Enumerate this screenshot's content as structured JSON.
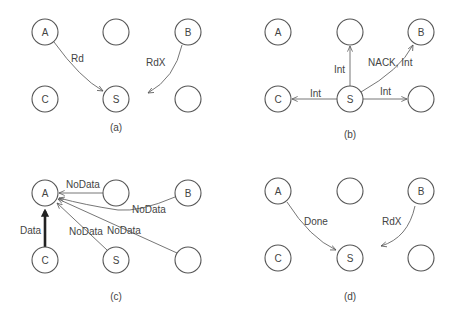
{
  "figure": {
    "panels": [
      {
        "id": "a",
        "caption": "(a)",
        "nodes": [
          {
            "id": "A",
            "label": "A",
            "x": 45,
            "y": 32
          },
          {
            "id": "top-mid",
            "label": "",
            "x": 116,
            "y": 32
          },
          {
            "id": "B",
            "label": "B",
            "x": 188,
            "y": 32
          },
          {
            "id": "C",
            "label": "C",
            "x": 45,
            "y": 99
          },
          {
            "id": "S",
            "label": "S",
            "x": 116,
            "y": 99
          },
          {
            "id": "right",
            "label": "",
            "x": 188,
            "y": 99
          }
        ],
        "edges": [
          {
            "from": "A",
            "to": "S",
            "label": "Rd",
            "bold": false
          },
          {
            "from": "B",
            "to": "S",
            "label": "RdX",
            "bold": false,
            "stops_short": true
          }
        ]
      },
      {
        "id": "b",
        "caption": "(b)",
        "nodes": [
          {
            "id": "A",
            "label": "A",
            "x": 278,
            "y": 32
          },
          {
            "id": "top-mid",
            "label": "",
            "x": 350,
            "y": 32
          },
          {
            "id": "B",
            "label": "B",
            "x": 421,
            "y": 32
          },
          {
            "id": "C",
            "label": "C",
            "x": 278,
            "y": 99
          },
          {
            "id": "S",
            "label": "S",
            "x": 350,
            "y": 99
          },
          {
            "id": "right",
            "label": "",
            "x": 421,
            "y": 99
          }
        ],
        "edges": [
          {
            "from": "S",
            "to": "top-mid",
            "label": "Int"
          },
          {
            "from": "S",
            "to": "B",
            "label": "NACK, Int"
          },
          {
            "from": "S",
            "to": "C",
            "label": "Int"
          },
          {
            "from": "S",
            "to": "right",
            "label": "Int"
          }
        ]
      },
      {
        "id": "c",
        "caption": "(c)",
        "nodes": [
          {
            "id": "A",
            "label": "A",
            "x": 45,
            "y": 193
          },
          {
            "id": "top-mid",
            "label": "",
            "x": 116,
            "y": 193
          },
          {
            "id": "B",
            "label": "B",
            "x": 188,
            "y": 193
          },
          {
            "id": "C",
            "label": "C",
            "x": 45,
            "y": 260
          },
          {
            "id": "S",
            "label": "S",
            "x": 116,
            "y": 260
          },
          {
            "id": "right",
            "label": "",
            "x": 188,
            "y": 260
          }
        ],
        "edges": [
          {
            "from": "C",
            "to": "A",
            "label": "Data",
            "bold": true
          },
          {
            "from": "top-mid",
            "to": "A",
            "label": "NoData"
          },
          {
            "from": "B",
            "to": "A",
            "label": "NoData"
          },
          {
            "from": "S",
            "to": "A",
            "label": "NoData"
          },
          {
            "from": "right",
            "to": "A",
            "label": "NoData"
          }
        ]
      },
      {
        "id": "d",
        "caption": "(d)",
        "nodes": [
          {
            "id": "A",
            "label": "A",
            "x": 278,
            "y": 191
          },
          {
            "id": "top-mid",
            "label": "",
            "x": 350,
            "y": 191
          },
          {
            "id": "B",
            "label": "B",
            "x": 421,
            "y": 191
          },
          {
            "id": "C",
            "label": "C",
            "x": 278,
            "y": 258
          },
          {
            "id": "S",
            "label": "S",
            "x": 350,
            "y": 258
          },
          {
            "id": "right",
            "label": "",
            "x": 421,
            "y": 258
          }
        ],
        "edges": [
          {
            "from": "A",
            "to": "S",
            "label": "Done"
          },
          {
            "from": "B",
            "to": "S",
            "label": "RdX",
            "stops_short": true
          }
        ]
      }
    ]
  }
}
